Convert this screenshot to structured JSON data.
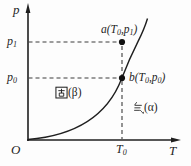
{
  "axes": {
    "y_label": "p",
    "x_label": "T",
    "origin": "O"
  },
  "ticks": {
    "p1": {
      "base": "p",
      "sub": "1",
      "full": "p₁"
    },
    "p0": {
      "base": "p",
      "sub": "0",
      "full": "p₀"
    },
    "T0": {
      "base": "T",
      "sub": "0",
      "full": "T₀"
    }
  },
  "points": {
    "a": {
      "full": "a(T₀,p₁)",
      "parts": [
        "a(T",
        "0",
        ",p",
        "1",
        ")"
      ]
    },
    "b": {
      "full": "b(T₀,p₀)",
      "parts": [
        "b(T",
        "0",
        ",p",
        "0",
        ")"
      ]
    }
  },
  "regions": {
    "solid": {
      "hanzi": "固",
      "suffix": "(β)",
      "full": "固(β)"
    },
    "gas": {
      "hanzi": "气",
      "suffix": "(α)",
      "full": "气(α)"
    }
  },
  "colors": {
    "ink": "#1f1f1f",
    "dash": "#3c3c3c",
    "background": "#fdfdfd"
  }
}
